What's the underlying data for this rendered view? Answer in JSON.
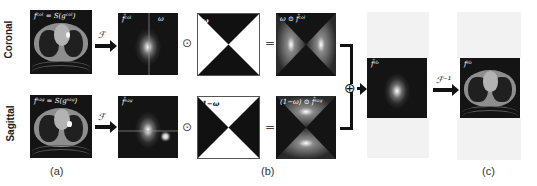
{
  "rows": [
    {
      "label": "Coronal"
    },
    {
      "label": "Sagittal"
    }
  ],
  "panels": {
    "coronal_image_label": "fᶜᵒˡ = S(gᶜᵒˡ)",
    "sagittal_image_label": "fˢᵃᵍ = S(gˢᵃᵍ)",
    "coronal_spectrum_label": "f̂ᶜᵒˡ",
    "coronal_spectrum_corner": "ω",
    "sagittal_spectrum_label": "f̂ˢᵃᵍ",
    "mask_top_label": "ω",
    "mask_bottom_label": "1−ω",
    "masked_top_label": "ω ⊙ f̂ᶜᵒˡ",
    "masked_bottom_label": "(1−ω) ⊙ f̂ˢᵃᵍ",
    "fused_spectrum_label": "f̂ˢᵇ",
    "output_image_label": "fˢᵇ"
  },
  "operators": {
    "fourier": "ℱ",
    "inverse_fourier": "ℱ⁻¹",
    "hadamard": "⊙",
    "equals": "=",
    "sum": "⊕"
  },
  "captions": {
    "a": "(a)",
    "b": "(b)",
    "c": "(c)"
  }
}
